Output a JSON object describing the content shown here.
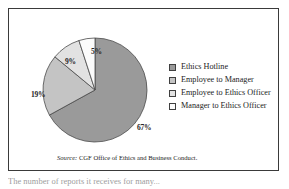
{
  "figure": {
    "source_prefix": "Source:",
    "source_text": " CGF Office of Ethics and Business Conduct.",
    "caption_partial": "The number of reports it receives for many..."
  },
  "legend": {
    "items": [
      {
        "label": "Ethics Hotline",
        "color": "#9a9a9a"
      },
      {
        "label": "Employee to Manager",
        "color": "#c4c4c4"
      },
      {
        "label": "Employee to Ethics Officer",
        "color": "#e2e2e2"
      },
      {
        "label": "Manager to Ethics Officer",
        "color": "#fbfbfb"
      }
    ]
  },
  "labels": {
    "pct_hotline": "67%",
    "pct_manager": "19%",
    "pct_employee_officer": "9%",
    "pct_manager_officer": "5%"
  },
  "chart_data": {
    "type": "pie",
    "title": "",
    "categories": [
      "Ethics Hotline",
      "Employee to Manager",
      "Employee to Ethics Officer",
      "Manager to Ethics Officer"
    ],
    "values": [
      67,
      19,
      9,
      5
    ],
    "value_labels": [
      "67%",
      "19%",
      "9%",
      "5%"
    ],
    "unit": "percent",
    "colors": [
      "#9a9a9a",
      "#c4c4c4",
      "#e2e2e2",
      "#fbfbfb"
    ],
    "slice_outline": "#4a4a4a",
    "start_angle_deg": -90,
    "direction": "clockwise",
    "legend_position": "right",
    "grid": false,
    "source": "Source: CGF Office of Ethics and Business Conduct."
  }
}
